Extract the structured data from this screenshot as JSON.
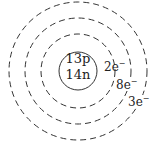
{
  "diagram": {
    "type": "bohr-model",
    "nucleus": {
      "protons": "13p",
      "neutrons": "14n"
    },
    "shells": [
      {
        "electrons": "2e",
        "charge": "−"
      },
      {
        "electrons": "8e",
        "charge": "−"
      },
      {
        "electrons": "3e",
        "charge": "−"
      }
    ],
    "colors": {
      "stroke": "#333333",
      "background": "#ffffff"
    }
  }
}
